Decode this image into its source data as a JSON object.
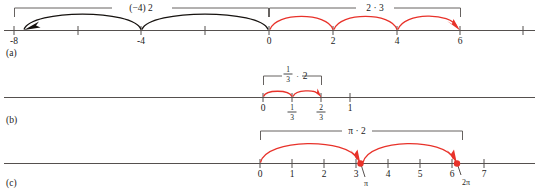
{
  "figure": {
    "caption_a": "(a)",
    "caption_b": "(b)",
    "caption_c": "(c)",
    "colors": {
      "accent_red": "#e8322a",
      "arc_black": "#16120f",
      "axis_gray": "#55504e",
      "text": "#1a1a1a",
      "background": "#ffffff"
    }
  },
  "panels": [
    {
      "id": "a",
      "label": "(a)",
      "axis_min": -8,
      "axis_max": 7,
      "tick_labels": [
        "-8",
        "-4",
        "0",
        "2",
        "4",
        "6"
      ],
      "tick_values": [
        -8,
        -4,
        0,
        2,
        4,
        6
      ],
      "minor_tick_values": [
        -6,
        -2,
        7
      ],
      "groups": [
        {
          "expression": "(−4) 2",
          "expr_parts": {
            "factor": "(−4)",
            "dot": "",
            "count": "2"
          },
          "color": "black",
          "from": 0,
          "to": -8,
          "step": -4,
          "hops": 2,
          "bracket_from": -8,
          "bracket_to": 0
        },
        {
          "expression": "2 · 3",
          "expr_parts": {
            "factor": "2",
            "dot": "·",
            "count": "3"
          },
          "color": "red",
          "from": 0,
          "to": 6,
          "step": 2,
          "hops": 3,
          "bracket_from": 0,
          "bracket_to": 6
        }
      ]
    },
    {
      "id": "b",
      "label": "(b)",
      "axis_min": 0,
      "axis_max": 1,
      "tick_labels": [
        "0",
        "1/3",
        "2/3",
        "1"
      ],
      "tick_values": [
        0,
        0.3333,
        0.6667,
        1
      ],
      "fraction_labels": [
        {
          "numerator": "1",
          "denominator": "3"
        },
        {
          "numerator": "2",
          "denominator": "3"
        }
      ],
      "groups": [
        {
          "expression": "1/3 · 2",
          "expr_parts": {
            "numerator": "1",
            "denominator": "3",
            "dot": "·",
            "count": "2"
          },
          "color": "red",
          "from": 0,
          "to": 0.6667,
          "hops": 2,
          "bracket_from": 0,
          "bracket_to": 0.6667
        }
      ]
    },
    {
      "id": "c",
      "label": "(c)",
      "axis_min": 0,
      "axis_max": 7,
      "tick_labels": [
        "0",
        "1",
        "2",
        "3",
        "4",
        "5",
        "6",
        "7"
      ],
      "tick_values": [
        0,
        1,
        2,
        3,
        4,
        5,
        6,
        7
      ],
      "special_labels": [
        {
          "text": "π",
          "value": 3.1416
        },
        {
          "text": "2π",
          "value": 6.2832
        }
      ],
      "groups": [
        {
          "expression": "π · 2",
          "expr_parts": {
            "factor": "π",
            "dot": "·",
            "count": "2"
          },
          "color": "red",
          "from": 0,
          "to": 6.2832,
          "hops": 2,
          "bracket_from": 0,
          "bracket_to": 6.2832
        }
      ]
    }
  ]
}
